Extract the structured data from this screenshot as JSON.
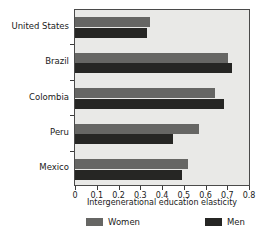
{
  "chart_data": {
    "type": "bar",
    "orientation": "horizontal",
    "title": "",
    "xlabel": "Intergenerational education elasticity",
    "ylabel": "",
    "xlim": [
      0,
      0.8
    ],
    "xticks": [
      "0",
      "0.1",
      "0.2",
      "0.3",
      "0.4",
      "0.5",
      "0.6",
      "0.7",
      "0.8"
    ],
    "xtick_values": [
      0,
      0.1,
      0.2,
      0.3,
      0.4,
      0.5,
      0.6,
      0.7,
      0.8
    ],
    "grid": false,
    "legend_position": "bottom",
    "categories": [
      "United States",
      "Brazil",
      "Colombia",
      "Peru",
      "Mexico"
    ],
    "series": [
      {
        "name": "Women",
        "color": "#666664",
        "values": [
          0.345,
          0.705,
          0.645,
          0.57,
          0.52
        ]
      },
      {
        "name": "Men",
        "color": "#262624",
        "values": [
          0.33,
          0.72,
          0.685,
          0.45,
          0.49
        ]
      }
    ]
  },
  "legend": {
    "women_label": "Women",
    "men_label": "Men"
  },
  "axis": {
    "x_title": "Intergenerational education elasticity"
  }
}
